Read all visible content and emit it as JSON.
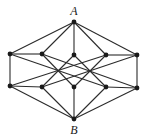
{
  "diagram": {
    "labels": {
      "top": "A",
      "bottom": "B"
    },
    "colors": {
      "edge": "#2b2b2b",
      "node": "#1a1a1a",
      "background": "#ffffff"
    },
    "nodes": [
      {
        "id": "A",
        "x": 74,
        "y": 22,
        "label": "A"
      },
      {
        "id": "L1",
        "x": 10,
        "y": 54
      },
      {
        "id": "L2",
        "x": 42,
        "y": 54
      },
      {
        "id": "M",
        "x": 74,
        "y": 55
      },
      {
        "id": "R2",
        "x": 106,
        "y": 55
      },
      {
        "id": "R1",
        "x": 137,
        "y": 55
      },
      {
        "id": "L1b",
        "x": 10,
        "y": 86
      },
      {
        "id": "L2b",
        "x": 42,
        "y": 87
      },
      {
        "id": "Mb",
        "x": 74,
        "y": 87
      },
      {
        "id": "R2b",
        "x": 106,
        "y": 87
      },
      {
        "id": "R1b",
        "x": 137,
        "y": 88
      },
      {
        "id": "B",
        "x": 74,
        "y": 119,
        "label": "B"
      }
    ],
    "edges": [
      [
        "A",
        "L1"
      ],
      [
        "A",
        "L2"
      ],
      [
        "A",
        "M"
      ],
      [
        "A",
        "R2"
      ],
      [
        "A",
        "R1"
      ],
      [
        "B",
        "L1b"
      ],
      [
        "B",
        "L2b"
      ],
      [
        "B",
        "Mb"
      ],
      [
        "B",
        "R2b"
      ],
      [
        "B",
        "R1b"
      ],
      [
        "L1",
        "L1b"
      ],
      [
        "R1",
        "R1b"
      ],
      [
        "L1",
        "L2"
      ],
      [
        "R2",
        "R1"
      ],
      [
        "L1b",
        "L2b"
      ],
      [
        "R2b",
        "R1b"
      ],
      [
        "L1",
        "R2b"
      ],
      [
        "L1b",
        "R2"
      ],
      [
        "R1",
        "L2b"
      ],
      [
        "R1b",
        "L2"
      ],
      [
        "L2",
        "Mb"
      ],
      [
        "R2",
        "Mb"
      ],
      [
        "M",
        "L2b"
      ],
      [
        "M",
        "R2b"
      ]
    ]
  }
}
